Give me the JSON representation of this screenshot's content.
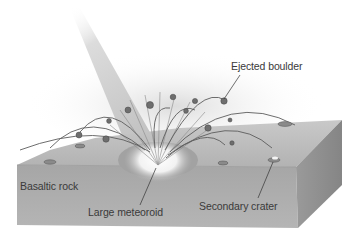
{
  "diagram": {
    "labels": {
      "ejected_boulder": "Ejected boulder",
      "basaltic_rock": "Basaltic rock",
      "large_meteoroid": "Large meteoroid",
      "secondary_crater": "Secondary crater"
    },
    "colors": {
      "block_top": "#b9b9b9",
      "block_front": "#a9a9a9",
      "block_side": "#8e8e8e",
      "trajectory_beam": "#d6d6d6",
      "boulder": "#6e6e6e",
      "crater_glow": "#ffffff",
      "leader_line": "#333333"
    }
  }
}
